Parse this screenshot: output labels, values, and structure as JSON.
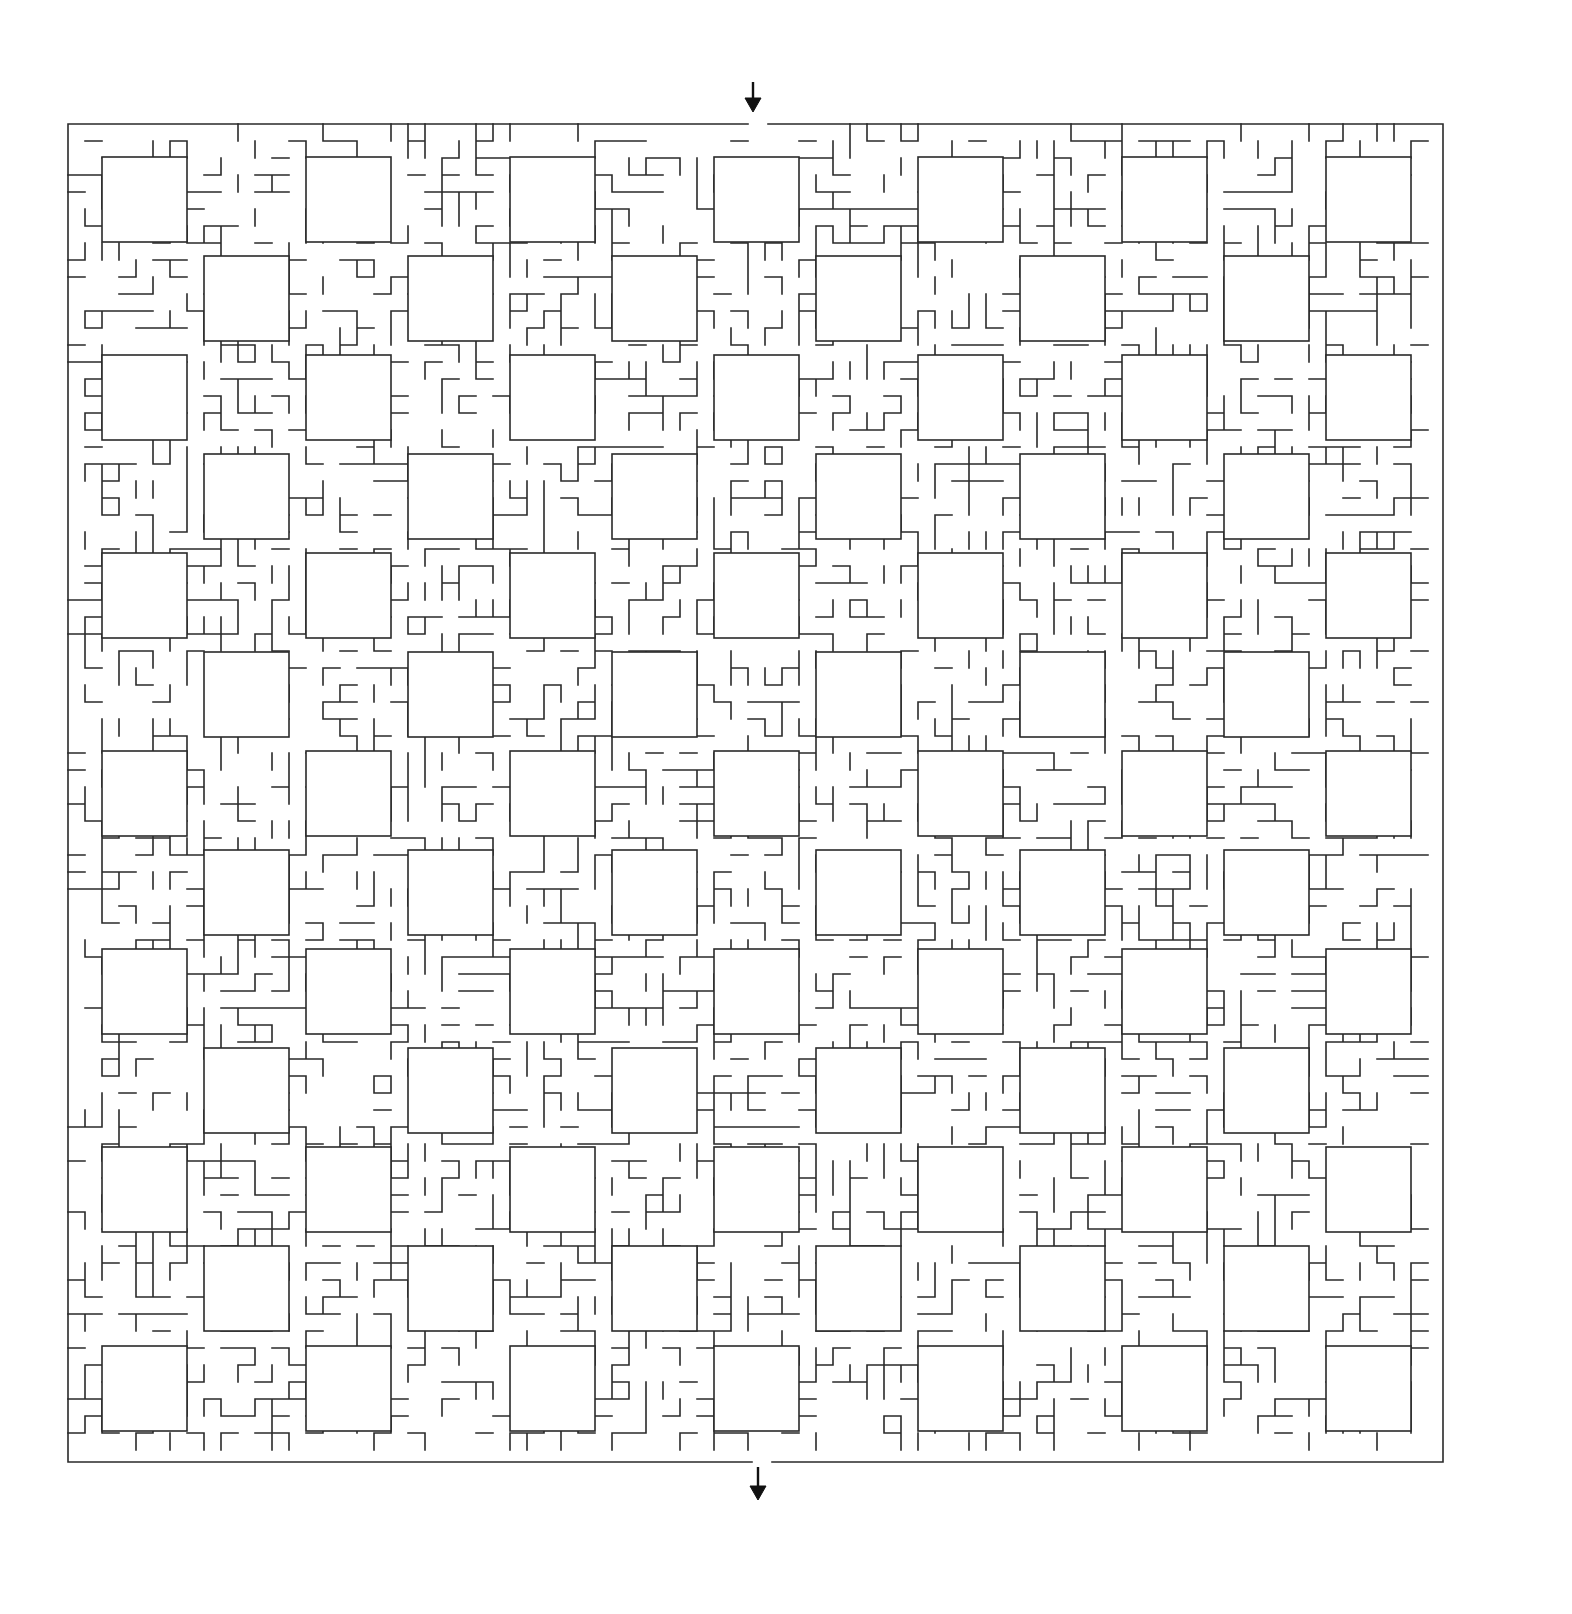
{
  "puzzle": {
    "type": "maze",
    "title": "",
    "cell_size": 17,
    "border": {
      "top_left": [
        68,
        125
      ],
      "top_right": [
        1441,
        123
      ],
      "bottom_left": [
        70,
        1463
      ],
      "bottom_right": [
        1444,
        1461
      ]
    },
    "entrance": {
      "label": "start-arrow",
      "x": 753,
      "gap": [
        748,
        768
      ],
      "side": "top",
      "arrow_y": [
        82,
        112
      ]
    },
    "exit": {
      "label": "end-arrow",
      "x": 758,
      "gap": [
        752,
        772
      ],
      "side": "bottom",
      "arrow_y": [
        1467,
        1500
      ]
    },
    "rooms": {
      "size": 85,
      "row_y": [
        157,
        256,
        355,
        454,
        553,
        652,
        751,
        850,
        949,
        1048,
        1147,
        1246,
        1346
      ],
      "even_row_x": [
        102,
        306,
        510,
        714,
        918,
        1122,
        1326
      ],
      "odd_row_x": [
        204,
        408,
        612,
        816,
        1020,
        1224
      ]
    },
    "colors": {
      "line": "#2a2a2a",
      "arrow": "#111111",
      "background": "#ffffff"
    }
  }
}
